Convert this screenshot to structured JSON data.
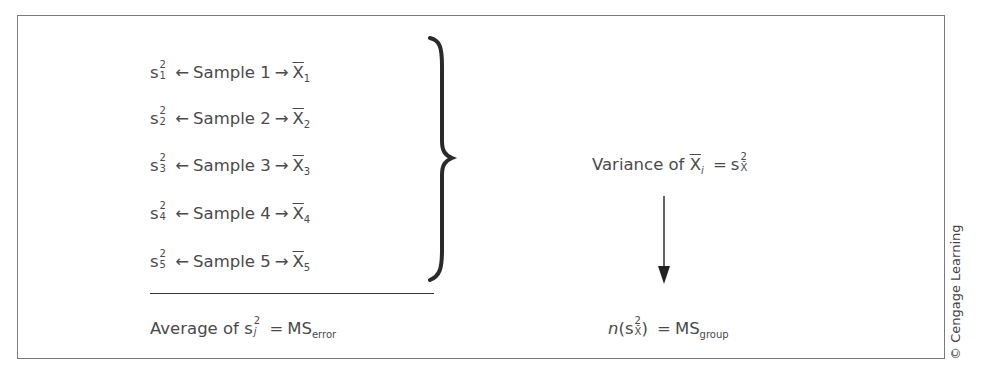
{
  "samples": [
    {
      "var_symbol": "s",
      "var_sup": "2",
      "var_sub": "1",
      "left_arrow": "←",
      "label": "Sample 1",
      "right_arrow": "→",
      "mean_symbol": "X",
      "mean_sub": "1"
    },
    {
      "var_symbol": "s",
      "var_sup": "2",
      "var_sub": "2",
      "left_arrow": "←",
      "label": "Sample 2",
      "right_arrow": "→",
      "mean_symbol": "X",
      "mean_sub": "2"
    },
    {
      "var_symbol": "s",
      "var_sup": "2",
      "var_sub": "3",
      "left_arrow": "←",
      "label": "Sample 3",
      "right_arrow": "→",
      "mean_symbol": "X",
      "mean_sub": "3"
    },
    {
      "var_symbol": "s",
      "var_sup": "2",
      "var_sub": "4",
      "left_arrow": "←",
      "label": "Sample 4",
      "right_arrow": "→",
      "mean_symbol": "X",
      "mean_sub": "4"
    },
    {
      "var_symbol": "s",
      "var_sup": "2",
      "var_sub": "5",
      "left_arrow": "←",
      "label": "Sample 5",
      "right_arrow": "→",
      "mean_symbol": "X",
      "mean_sub": "5"
    }
  ],
  "average": {
    "prefix": "Average of",
    "var_symbol": "s",
    "var_sup": "2",
    "var_sub": "j",
    "equals": "=",
    "ms": "MS",
    "ms_sub": "error"
  },
  "variance_of_means": {
    "prefix": "Variance of",
    "mean_symbol": "X",
    "mean_sub": "i",
    "equals": "=",
    "s_symbol": "s",
    "s_sup": "2",
    "s_sub": "X̄"
  },
  "ms_group": {
    "n": "n",
    "open_paren": "(",
    "s_symbol": "s",
    "s_sup": "2",
    "s_sub": "X̄",
    "close_paren": ")",
    "equals": "=",
    "ms": "MS",
    "ms_sub": "group"
  },
  "credit": "© Cengage Learning",
  "colors": {
    "text": "#4a4a4a",
    "frame": "#7a7a7a",
    "lines": "#333333"
  }
}
